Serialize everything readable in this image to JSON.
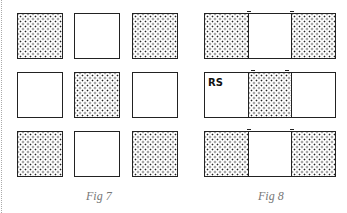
{
  "figures": [
    {
      "caption": "Fig 7",
      "grid": [
        [
          "dotted",
          "blank",
          "dotted"
        ],
        [
          "blank",
          "dotted",
          "blank"
        ],
        [
          "dotted",
          "blank",
          "dotted"
        ]
      ]
    },
    {
      "caption": "Fig 8",
      "strips": [
        {
          "cells": [
            "dotted",
            "blank",
            "dotted"
          ],
          "label": ""
        },
        {
          "cells": [
            "blank",
            "dotted",
            "blank"
          ],
          "label": "RS"
        },
        {
          "cells": [
            "dotted",
            "blank",
            "dotted"
          ],
          "label": ""
        }
      ]
    }
  ],
  "colors": {
    "ink": "#222222",
    "caption": "#777777",
    "background": "#ffffff"
  }
}
